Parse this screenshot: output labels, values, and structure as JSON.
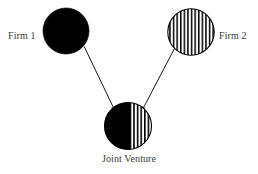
{
  "figure": {
    "background_color": "#ffffff",
    "width": 258,
    "height": 174
  },
  "nodes": [
    {
      "id": "firm1",
      "label": "Firm 1",
      "shape": "circle",
      "fill": "solid-black",
      "fill_color": "#000000",
      "cx": 66,
      "cy": 31,
      "r": 23,
      "label_position": "left"
    },
    {
      "id": "firm2",
      "label": "Firm 2",
      "shape": "circle",
      "fill": "vertical-stripes",
      "fill_color": "#ffffff",
      "stroke_color": "#000000",
      "stripe_count": 13,
      "cx": 191,
      "cy": 32,
      "r": 23,
      "label_position": "right"
    },
    {
      "id": "joint-venture",
      "label": "Joint Venture",
      "shape": "circle",
      "fill": "half-black-half-striped",
      "fill_color": "#000000",
      "stroke_color": "#000000",
      "stripe_count": 6,
      "cx": 128,
      "cy": 126,
      "r": 23,
      "label_position": "below"
    }
  ],
  "edges": [
    {
      "id": "firm1-to-jv",
      "from": "firm1",
      "to": "joint-venture",
      "arrowhead": "filled-triangle",
      "color": "#000000"
    },
    {
      "id": "firm2-to-jv",
      "from": "firm2",
      "to": "joint-venture",
      "arrowhead": "filled-triangle",
      "color": "#000000"
    }
  ],
  "colors": {
    "ink": "#000000",
    "text": "#3b3b3b",
    "paper": "#ffffff"
  }
}
